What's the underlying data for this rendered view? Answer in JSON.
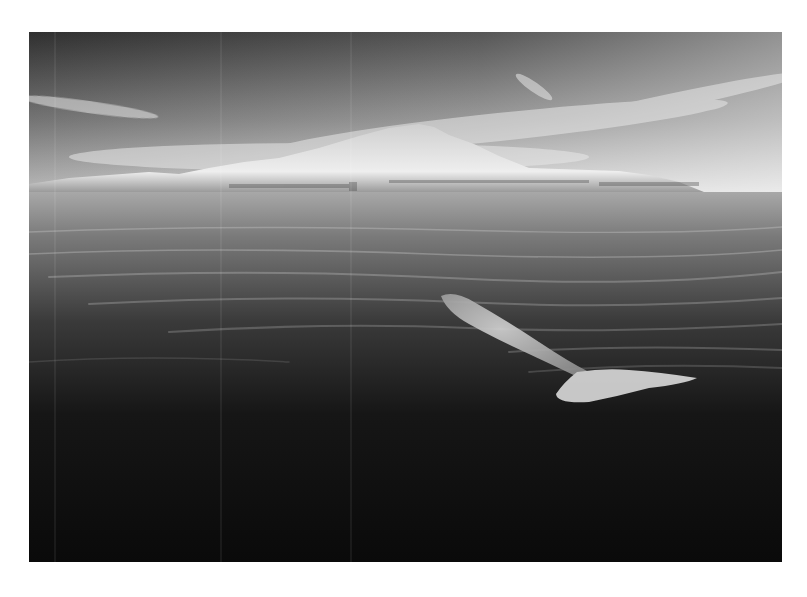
{
  "photo": {
    "subject": "whale swimming near surface in calm sea with island in background",
    "style": "black-and-white",
    "colors": {
      "page_background": "#ffffff",
      "sky_top": "#3c3c3c",
      "sky_horizon": "#d8d8d8",
      "island": "#e6e6e6",
      "water_near_horizon": "#9a9a9a",
      "water_deep": "#0d0d0d",
      "whale": "#bdbdbd"
    }
  }
}
